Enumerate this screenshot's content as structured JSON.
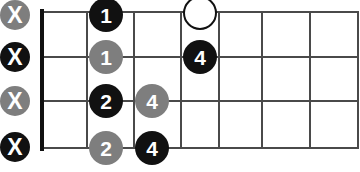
{
  "diagram": {
    "kind": "guitar-chord-fretboard",
    "orientation": "horizontal",
    "width": 360,
    "height": 172,
    "strings": 4,
    "frets": 7,
    "colors": {
      "dark": "#111111",
      "gray": "#7e7e7e",
      "grid": "#4a4a4a",
      "background": "#ffffff",
      "marker_text": "#ffffff"
    },
    "grid": {
      "nut_x": 40,
      "nut_width": 4,
      "left": 40,
      "right": 358,
      "top": 12,
      "bottom": 148,
      "string_y": [
        12,
        57,
        101,
        148
      ],
      "fret_x": [
        40,
        87,
        134,
        181,
        219,
        262,
        310,
        358
      ]
    },
    "mute_markers": [
      {
        "label": "X",
        "style": "gray",
        "x": 15,
        "y": 15,
        "size": 30,
        "string": 1
      },
      {
        "label": "X",
        "style": "dark",
        "x": 15,
        "y": 57,
        "size": 30,
        "string": 2
      },
      {
        "label": "X",
        "style": "gray",
        "x": 15,
        "y": 101,
        "size": 30,
        "string": 3
      },
      {
        "label": "X",
        "style": "dark",
        "x": 15,
        "y": 147,
        "size": 30,
        "string": 4
      }
    ],
    "finger_markers": [
      {
        "label": "1",
        "style": "dark",
        "x": 106,
        "y": 15,
        "size": 34,
        "string": 1,
        "fret": 2
      },
      {
        "label": "",
        "style": "open",
        "x": 200,
        "y": 13,
        "size": 34,
        "string": 1,
        "fret": 4
      },
      {
        "label": "1",
        "style": "gray",
        "x": 106,
        "y": 57,
        "size": 34,
        "string": 2,
        "fret": 2
      },
      {
        "label": "4",
        "style": "dark",
        "x": 200,
        "y": 57,
        "size": 34,
        "string": 2,
        "fret": 4
      },
      {
        "label": "2",
        "style": "dark",
        "x": 106,
        "y": 101,
        "size": 34,
        "string": 3,
        "fret": 2
      },
      {
        "label": "4",
        "style": "gray",
        "x": 152,
        "y": 101,
        "size": 34,
        "string": 3,
        "fret": 3
      },
      {
        "label": "2",
        "style": "gray",
        "x": 106,
        "y": 148,
        "size": 34,
        "string": 4,
        "fret": 2
      },
      {
        "label": "4",
        "style": "dark",
        "x": 152,
        "y": 148,
        "size": 34,
        "string": 4,
        "fret": 3
      }
    ]
  }
}
